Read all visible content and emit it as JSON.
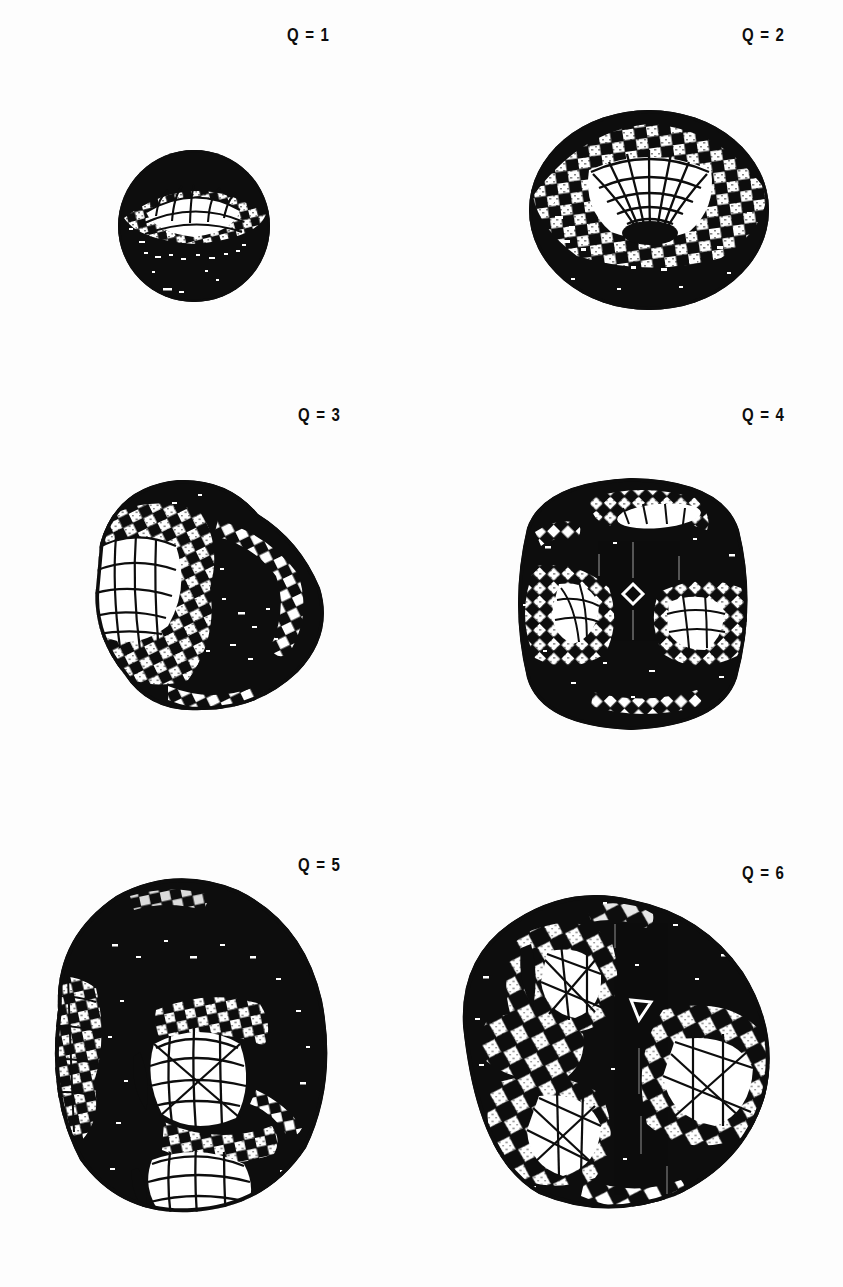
{
  "figure": {
    "background_color": "#ffffff",
    "ink_color": "#0d0d0d",
    "highlight_color": "#ffffff",
    "layout": {
      "rows": 3,
      "columns": 2
    },
    "artifact_text": ""
  },
  "panels": [
    {
      "id": "q1",
      "label": "Q = 1",
      "label_x": 287,
      "label_y": 33,
      "charge": 1,
      "symmetry": "spherical",
      "shape_type": "sphere",
      "lobes": 1,
      "center_x": 192,
      "center_y": 224,
      "radius_x": 74,
      "radius_y": 76,
      "mesh": "checkerboard-latitude-longitude"
    },
    {
      "id": "q2",
      "label": "Q = 2",
      "label_x": 742,
      "label_y": 33,
      "charge": 2,
      "symmetry": "axial-toroidal",
      "shape_type": "torus",
      "lobes": 1,
      "center_x": 646,
      "center_y": 208,
      "radius_x": 118,
      "radius_y": 98,
      "mesh": "checkerboard-with-central-funnel"
    },
    {
      "id": "q3",
      "label": "Q = 3",
      "label_x": 298,
      "label_y": 410,
      "charge": 3,
      "symmetry": "tetrahedral",
      "shape_type": "trilobed",
      "lobes": 3,
      "center_x": 205,
      "center_y": 595,
      "radius_x": 125,
      "radius_y": 137,
      "mesh": "checkerboard-on-left-lobe"
    },
    {
      "id": "q4",
      "label": "Q = 4",
      "label_x": 742,
      "label_y": 410,
      "charge": 4,
      "symmetry": "cubic",
      "shape_type": "rounded-cube",
      "lobes": 4,
      "center_x": 630,
      "center_y": 600,
      "radius_x": 140,
      "radius_y": 142,
      "mesh": "diamond-lattice-with-craters"
    },
    {
      "id": "q5",
      "label": "Q = 5",
      "label_x": 298,
      "label_y": 858,
      "charge": 5,
      "symmetry": "D2d",
      "shape_type": "multilobed",
      "lobes": 5,
      "center_x": 182,
      "center_y": 1042,
      "radius_x": 143,
      "radius_y": 172,
      "mesh": "checkerboard-with-two-craters"
    },
    {
      "id": "q6",
      "label": "Q = 6",
      "label_x": 742,
      "label_y": 866,
      "charge": 6,
      "symmetry": "D4d",
      "shape_type": "multilobed",
      "lobes": 6,
      "center_x": 612,
      "center_y": 1046,
      "radius_x": 172,
      "radius_y": 170,
      "mesh": "triangulated-with-three-craters"
    }
  ]
}
